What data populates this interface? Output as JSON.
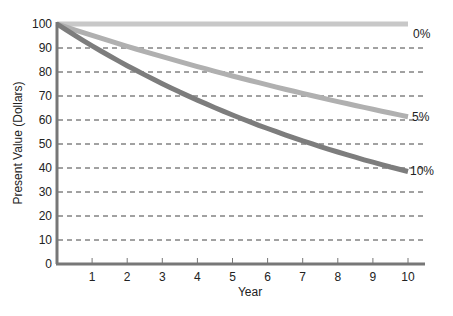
{
  "chart_data": {
    "type": "line",
    "title": "",
    "xlabel": "Year",
    "ylabel": "Present Value (Dollars)",
    "x": [
      0,
      1,
      2,
      3,
      4,
      5,
      6,
      7,
      8,
      9,
      10
    ],
    "xticks": [
      "1",
      "2",
      "3",
      "4",
      "5",
      "6",
      "7",
      "8",
      "9",
      "10"
    ],
    "yticks": [
      "0",
      "10",
      "20",
      "30",
      "40",
      "50",
      "60",
      "70",
      "80",
      "90",
      "100"
    ],
    "xlim": [
      0,
      10
    ],
    "ylim": [
      0,
      100
    ],
    "grid": "horizontal dashed",
    "series": [
      {
        "name": "0%",
        "color": "#c8c8c8",
        "values": [
          100,
          100,
          100,
          100,
          100,
          100,
          100,
          100,
          100,
          100,
          100
        ]
      },
      {
        "name": "5%",
        "color": "#b0b0b0",
        "values": [
          100,
          95.24,
          90.7,
          86.38,
          82.27,
          78.35,
          74.62,
          71.07,
          67.68,
          64.46,
          61.39
        ]
      },
      {
        "name": "10%",
        "color": "#7d7d7d",
        "values": [
          100,
          90.91,
          82.64,
          75.13,
          68.3,
          62.09,
          56.45,
          51.32,
          46.65,
          42.41,
          38.55
        ]
      }
    ]
  }
}
